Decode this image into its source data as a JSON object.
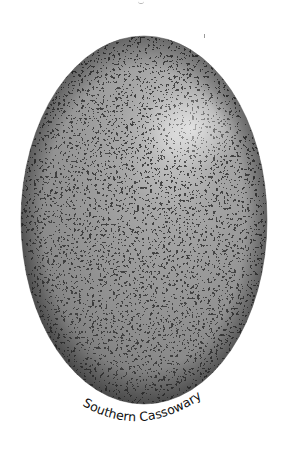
{
  "figure": {
    "caption": "Southern Cassowary",
    "colors": {
      "background": "#ffffff",
      "shell_base": "#8e8e8e",
      "shell_dark_speckle": "#3f3f3f",
      "shell_light_network": "#b8b8b8",
      "highlight": "#d9d9d9",
      "caption_text": "#111111"
    }
  }
}
